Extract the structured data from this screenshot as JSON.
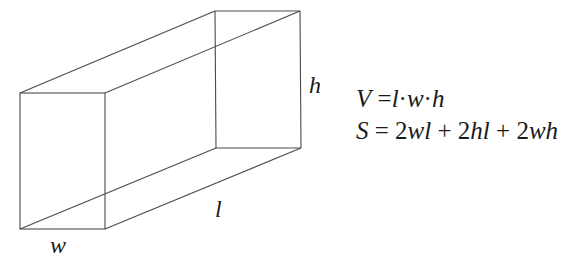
{
  "figure": {
    "type": "rectangular-prism",
    "stroke_color": "#4a4a4a",
    "vertices": {
      "front_top_left": [
        20,
        93
      ],
      "front_top_right": [
        105,
        93
      ],
      "front_bottom_left": [
        20,
        229
      ],
      "front_bottom_right": [
        105,
        229
      ],
      "back_top_left": [
        215,
        11
      ],
      "back_top_right": [
        300,
        11
      ],
      "back_bottom_left": [
        216,
        148
      ],
      "back_bottom_right": [
        301,
        148
      ]
    },
    "labels": {
      "height": "h",
      "length": "l",
      "width": "w"
    }
  },
  "formulas": {
    "volume": {
      "lhs": "V",
      "eq": "=",
      "terms": [
        "l",
        "·",
        "w",
        "·",
        "h"
      ]
    },
    "surface_area": {
      "lhs": "S",
      "eq": "=",
      "terms": [
        "2",
        "wl",
        "+",
        "2",
        "hl",
        "+",
        "2",
        "wh"
      ]
    }
  }
}
